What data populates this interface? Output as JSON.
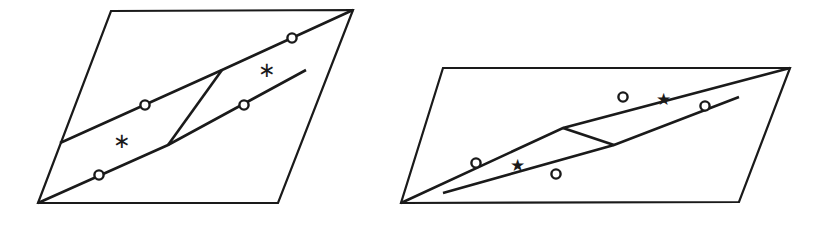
{
  "page": {
    "background_color": "#ffffff",
    "stroke_color": "#1a1a1a",
    "width": 819,
    "height": 227
  },
  "figures": [
    {
      "id": "left-figure",
      "name": "left-parallelogram-figure",
      "outline_name": "parallelogram-outline",
      "outline_points": "111,11 353,10 278,203 38,203",
      "strips": [
        {
          "name": "upper-strip-lower-edge",
          "points": "60,143 222,70"
        },
        {
          "name": "upper-strip-upper-edge",
          "points": "168,145 353,10"
        },
        {
          "name": "lower-strip-upper-edge",
          "points": "222,70 306,70"
        },
        {
          "name": "lower-strip-lower-edge",
          "points": "38,203 168,145"
        }
      ],
      "polyline_upper": "60,143 222,70 353,10",
      "polyline_lower": "38,203 168,145 306,70",
      "connector": {
        "name": "connector-segment",
        "points": "168,145 222,70"
      },
      "markers": [
        {
          "name": "node-marker-upper-left",
          "cx": 145,
          "cy": 105,
          "r": 4.6
        },
        {
          "name": "node-marker-upper-right",
          "cx": 292,
          "cy": 38,
          "r": 4.6
        },
        {
          "name": "node-marker-lower-left",
          "cx": 99,
          "cy": 175,
          "r": 4.6
        },
        {
          "name": "node-marker-lower-right",
          "cx": 244,
          "cy": 105,
          "r": 4.6
        }
      ],
      "labels": [
        {
          "name": "region-label-lower",
          "glyph": "∗",
          "x": 122,
          "y": 143,
          "style": "asterisk"
        },
        {
          "name": "region-label-upper",
          "glyph": "∗",
          "x": 267,
          "y": 72,
          "style": "asterisk"
        }
      ]
    },
    {
      "id": "right-figure",
      "name": "right-parallelogram-figure",
      "outline_name": "parallelogram-outline",
      "outline_points": "443,68 790,68 739,202 401,203",
      "polyline_upper": "401,203 563,128 790,68",
      "polyline_lower": "443,193 614,145 739,97",
      "connector": {
        "name": "connector-segment",
        "points": "563,128 614,145"
      },
      "markers": [
        {
          "name": "node-marker-upper-left",
          "cx": 476,
          "cy": 163,
          "r": 4.6
        },
        {
          "name": "node-marker-upper-right",
          "cx": 623,
          "cy": 97,
          "r": 4.6
        },
        {
          "name": "node-marker-lower-left",
          "cx": 556,
          "cy": 174,
          "r": 4.6
        },
        {
          "name": "node-marker-lower-right",
          "cx": 705,
          "cy": 106,
          "r": 4.6
        }
      ],
      "labels": [
        {
          "name": "region-label-lower",
          "glyph": "★",
          "x": 517,
          "y": 167,
          "style": "star"
        },
        {
          "name": "region-label-upper",
          "glyph": "★",
          "x": 663,
          "y": 101,
          "style": "star"
        }
      ]
    }
  ]
}
